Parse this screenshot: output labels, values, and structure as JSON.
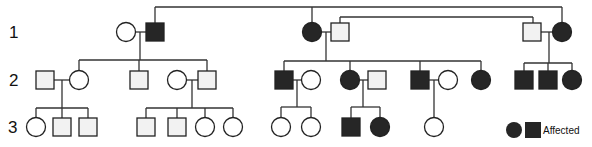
{
  "generations": [
    {
      "label": "1"
    },
    {
      "label": "2"
    },
    {
      "label": "3"
    }
  ],
  "colors": {
    "affected": "#262626",
    "unaffected_square": "#f2f2f2",
    "unaffected_circle": "#ffffff",
    "line": "#333333"
  },
  "individuals": [
    {
      "id": "I-1",
      "gen": 1,
      "sex": "female",
      "affected": false
    },
    {
      "id": "I-2",
      "gen": 1,
      "sex": "male",
      "affected": true
    },
    {
      "id": "I-3",
      "gen": 1,
      "sex": "female",
      "affected": true
    },
    {
      "id": "I-4",
      "gen": 1,
      "sex": "male",
      "affected": false
    },
    {
      "id": "I-5",
      "gen": 1,
      "sex": "male",
      "affected": false
    },
    {
      "id": "I-6",
      "gen": 1,
      "sex": "female",
      "affected": true
    },
    {
      "id": "II-1",
      "gen": 2,
      "sex": "male",
      "affected": false
    },
    {
      "id": "II-2",
      "gen": 2,
      "sex": "female",
      "affected": false
    },
    {
      "id": "II-3",
      "gen": 2,
      "sex": "male",
      "affected": false
    },
    {
      "id": "II-4",
      "gen": 2,
      "sex": "female",
      "affected": false
    },
    {
      "id": "II-5",
      "gen": 2,
      "sex": "male",
      "affected": false
    },
    {
      "id": "II-6",
      "gen": 2,
      "sex": "male",
      "affected": true
    },
    {
      "id": "II-7",
      "gen": 2,
      "sex": "female",
      "affected": false
    },
    {
      "id": "II-8",
      "gen": 2,
      "sex": "female",
      "affected": true
    },
    {
      "id": "II-9",
      "gen": 2,
      "sex": "male",
      "affected": false
    },
    {
      "id": "II-10",
      "gen": 2,
      "sex": "male",
      "affected": true
    },
    {
      "id": "II-11",
      "gen": 2,
      "sex": "female",
      "affected": false
    },
    {
      "id": "II-12",
      "gen": 2,
      "sex": "female",
      "affected": true
    },
    {
      "id": "II-13",
      "gen": 2,
      "sex": "male",
      "affected": true
    },
    {
      "id": "II-14",
      "gen": 2,
      "sex": "male",
      "affected": true
    },
    {
      "id": "II-15",
      "gen": 2,
      "sex": "female",
      "affected": true
    },
    {
      "id": "III-1",
      "gen": 3,
      "sex": "female",
      "affected": false
    },
    {
      "id": "III-2",
      "gen": 3,
      "sex": "male",
      "affected": false
    },
    {
      "id": "III-3",
      "gen": 3,
      "sex": "male",
      "affected": false
    },
    {
      "id": "III-4",
      "gen": 3,
      "sex": "male",
      "affected": false
    },
    {
      "id": "III-5",
      "gen": 3,
      "sex": "male",
      "affected": false
    },
    {
      "id": "III-6",
      "gen": 3,
      "sex": "female",
      "affected": false
    },
    {
      "id": "III-7",
      "gen": 3,
      "sex": "female",
      "affected": false
    },
    {
      "id": "III-8",
      "gen": 3,
      "sex": "female",
      "affected": false
    },
    {
      "id": "III-9",
      "gen": 3,
      "sex": "female",
      "affected": false
    },
    {
      "id": "III-10",
      "gen": 3,
      "sex": "male",
      "affected": true
    },
    {
      "id": "III-11",
      "gen": 3,
      "sex": "female",
      "affected": true
    },
    {
      "id": "III-12",
      "gen": 3,
      "sex": "female",
      "affected": false
    }
  ],
  "legend": {
    "label": "Affected",
    "symbols": [
      "female-affected",
      "male-affected"
    ]
  }
}
